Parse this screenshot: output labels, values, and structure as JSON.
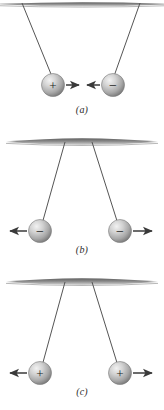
{
  "figure": {
    "caption_style": "italic-parenthetical",
    "background_color": "#ffffff",
    "ink_color": "#4a4a4a",
    "sphere_fill_light": "#e8e8e8",
    "sphere_fill_mid": "#b9b9b9",
    "sphere_fill_dark": "#8f8f8f",
    "bar_color_top": "#6f6f6f",
    "bar_color_bottom": "#cfcfcf",
    "string_color": "#555555",
    "arrow_color": "#3a3a3a",
    "sign_color": "#1a1a1a"
  },
  "panels": [
    {
      "id": "a",
      "label": "(a)",
      "description": "Opposite charges attract",
      "support": "ceiling-bar",
      "spheres": [
        {
          "side": "left",
          "charge": "+",
          "charge_name": "positive",
          "arrow_direction": "right",
          "arrow_name": "attraction-arrow-right"
        },
        {
          "side": "right",
          "charge": "−",
          "charge_name": "negative",
          "arrow_direction": "left",
          "arrow_name": "attraction-arrow-left"
        }
      ]
    },
    {
      "id": "b",
      "label": "(b)",
      "description": "Like negative charges repel",
      "support": "ceiling-bar",
      "spheres": [
        {
          "side": "left",
          "charge": "−",
          "charge_name": "negative",
          "arrow_direction": "left",
          "arrow_name": "repulsion-arrow-left"
        },
        {
          "side": "right",
          "charge": "−",
          "charge_name": "negative",
          "arrow_direction": "right",
          "arrow_name": "repulsion-arrow-right"
        }
      ]
    },
    {
      "id": "c",
      "label": "(c)",
      "description": "Like positive charges repel",
      "support": "ceiling-bar",
      "spheres": [
        {
          "side": "left",
          "charge": "+",
          "charge_name": "positive",
          "arrow_direction": "left",
          "arrow_name": "repulsion-arrow-left"
        },
        {
          "side": "right",
          "charge": "+",
          "charge_name": "positive",
          "arrow_direction": "right",
          "arrow_name": "repulsion-arrow-right"
        }
      ]
    }
  ]
}
